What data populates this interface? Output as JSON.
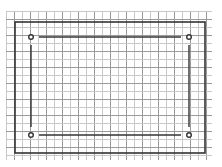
{
  "diagram": {
    "type": "grid-layout-drawing",
    "background": "#ffffff",
    "grid": {
      "x0": 6,
      "y0": 11,
      "x1": 212,
      "y1": 160,
      "minor_step": 8,
      "minor_color": "#c8c8c8",
      "major_every": 2,
      "major_color": "#9a9a9a"
    },
    "outer_rect": {
      "x": 15,
      "y": 22,
      "width": 190,
      "height": 131,
      "stroke": "#333333",
      "stroke_width": 1.6
    },
    "inner_lines_color": "#333333",
    "markers": [
      {
        "name": "top-left",
        "x": 31,
        "y": 37
      },
      {
        "name": "top-right",
        "x": 189,
        "y": 37
      },
      {
        "name": "bottom-left",
        "x": 31,
        "y": 135
      },
      {
        "name": "bottom-right",
        "x": 189,
        "y": 135
      }
    ],
    "marker_color": "#333333"
  }
}
